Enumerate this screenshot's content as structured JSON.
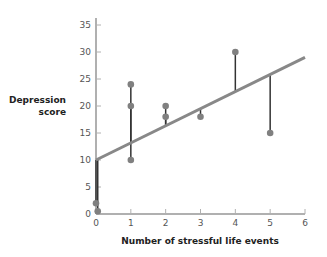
{
  "chart_data": {
    "type": "scatter",
    "title": "",
    "xlabel": "Number of stressful life events",
    "ylabel_line1": "Depression",
    "ylabel_line2": "score",
    "xlim": [
      0,
      6
    ],
    "ylim": [
      0,
      35
    ],
    "x_ticks": [
      "0",
      "1",
      "2",
      "3",
      "4",
      "5",
      "6"
    ],
    "y_ticks": [
      "0",
      "5",
      "10",
      "15",
      "20",
      "25",
      "30",
      "35"
    ],
    "grid": false,
    "points": [
      {
        "x": 0,
        "y": 2
      },
      {
        "x": 0.05,
        "y": 0.5
      },
      {
        "x": 1,
        "y": 24
      },
      {
        "x": 1,
        "y": 20
      },
      {
        "x": 1,
        "y": 10
      },
      {
        "x": 2,
        "y": 20
      },
      {
        "x": 2,
        "y": 18
      },
      {
        "x": 3,
        "y": 18
      },
      {
        "x": 4,
        "y": 30
      },
      {
        "x": 5,
        "y": 15
      }
    ],
    "regression_line": {
      "x0": 0,
      "y0": 10,
      "x1": 6,
      "y1": 29
    },
    "residual_lines": true,
    "colors": {
      "axis": "#b0b0b0",
      "line": "#888888",
      "point": "#808080",
      "residual": "#333333"
    }
  }
}
